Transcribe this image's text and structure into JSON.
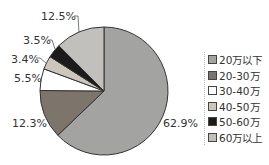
{
  "chart_data": {
    "type": "pie",
    "title": "",
    "categories": [
      "20万以下",
      "20-30万",
      "30-40万",
      "40-50万",
      "50-60万",
      "60万以上"
    ],
    "values": [
      62.9,
      12.3,
      5.5,
      3.4,
      3.5,
      12.5
    ],
    "labels": [
      "62.9%",
      "12.3%",
      "5.5%",
      "3.4%",
      "3.5%",
      "12.5%"
    ],
    "colors": [
      "#a3a3a1",
      "#7d756c",
      "#ffffff",
      "#cdc6bb",
      "#1c1a1a",
      "#c2c0bc"
    ],
    "legend_position": "right"
  },
  "legend": {
    "items": [
      {
        "label": "20万以下",
        "color": "#a3a3a1"
      },
      {
        "label": "20-30万",
        "color": "#7d756c"
      },
      {
        "label": "30-40万",
        "color": "#ffffff"
      },
      {
        "label": "40-50万",
        "color": "#cdc6bb"
      },
      {
        "label": "50-60万",
        "color": "#1c1a1a"
      },
      {
        "label": "60万以上",
        "color": "#c2c0bc"
      }
    ]
  },
  "slice_labels": {
    "s0": "62.9%",
    "s1": "12.3%",
    "s2": "5.5%",
    "s3": "3.4%",
    "s4": "3.5%",
    "s5": "12.5%"
  }
}
